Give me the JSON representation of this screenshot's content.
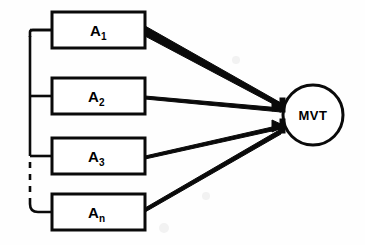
{
  "diagram": {
    "type": "block-diagram",
    "title": "",
    "background_color": "#fefefe",
    "line_color": "#0a0a0a",
    "boxes": [
      {
        "id": "a1",
        "base": "A",
        "subscript": "1",
        "label": "A1"
      },
      {
        "id": "a2",
        "base": "A",
        "subscript": "2",
        "label": "A2"
      },
      {
        "id": "a3",
        "base": "A",
        "subscript": "3",
        "label": "A3"
      },
      {
        "id": "an",
        "base": "A",
        "subscript": "n",
        "label": "An"
      }
    ],
    "node": {
      "id": "mvt",
      "label": "MVT",
      "shape": "circle"
    },
    "rail": {
      "solid_label": "solid bus rail",
      "dashed_label": "dashed continuation"
    },
    "junctions": [
      {
        "id": "upper",
        "label": "upper arrow junction"
      },
      {
        "id": "lower",
        "label": "lower arrow junction"
      }
    ]
  }
}
